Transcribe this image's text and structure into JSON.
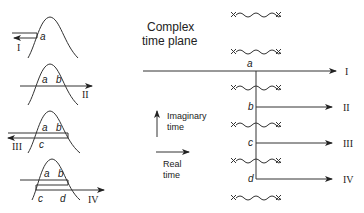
{
  "title": {
    "line1": "Complex",
    "line2": "time plane"
  },
  "legend": {
    "imaginary_line1": "Imaginary",
    "imaginary_line2": "time",
    "real_line1": "Real",
    "real_line2": "time"
  },
  "left_panels": [
    {
      "roman": "I",
      "labels": [
        "a"
      ]
    },
    {
      "roman": "II",
      "labels": [
        "a",
        "b"
      ]
    },
    {
      "roman": "III",
      "labels": [
        "a",
        "b",
        "c"
      ]
    },
    {
      "roman": "IV",
      "labels": [
        "a",
        "b",
        "c",
        "d"
      ]
    }
  ],
  "contour": {
    "points": [
      "a",
      "b",
      "c",
      "d"
    ],
    "outputs": [
      "I",
      "II",
      "III",
      "IV"
    ]
  },
  "colors": {
    "stroke": "#333333",
    "text": "#222222",
    "background": "#ffffff"
  }
}
